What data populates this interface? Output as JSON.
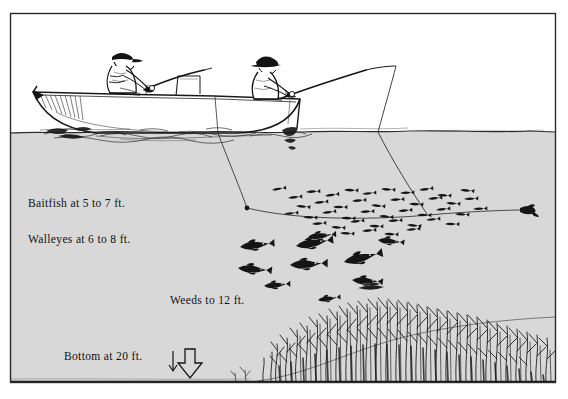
{
  "illustration": {
    "title": "Walleye trolling over a weed bed",
    "medium": "pen-and-ink line drawing",
    "border": {
      "color": "#2a2a2a",
      "x": 10,
      "y": 13,
      "width": 546,
      "height": 370
    }
  },
  "colors": {
    "sky": "#ffffff",
    "water": "#d8d8d8",
    "ink": "#111111",
    "line_ink": "#2b2b2b",
    "paper": "#ffffff"
  },
  "labels": [
    {
      "id": "baitfish-depth",
      "text": "Baitfish at 5 to 7 ft.",
      "x": 28,
      "y": 207
    },
    {
      "id": "walleye-depth",
      "text": "Walleyes at 6 to 8 ft.",
      "x": 28,
      "y": 243
    },
    {
      "id": "weeds-depth",
      "text": "Weeds to 12 ft.",
      "x": 170,
      "y": 304
    },
    {
      "id": "bottom-depth",
      "text": "Bottom at 20 ft.",
      "x": 64,
      "y": 360
    }
  ],
  "scene": {
    "waterline_y": 132,
    "lakebed_y": 381,
    "boat": {
      "name": "fishing-boat",
      "bow_x": 33,
      "stern_x": 300,
      "gunwale_y": 96
    },
    "anglers": [
      {
        "id": "angler-bow",
        "hat": "cap",
        "x": 120,
        "y": 58,
        "rod_direction": "right"
      },
      {
        "id": "angler-stern",
        "hat": "brimmed-hat",
        "x": 266,
        "y": 62,
        "rod_direction": "right"
      }
    ],
    "lines": [
      {
        "id": "trolling-line-left",
        "enters_water_x": 218,
        "weight_x": 247,
        "weight_y": 208
      },
      {
        "id": "trolling-line-right",
        "enters_water_x": 378,
        "lure_x": 527,
        "lure_y": 210
      }
    ],
    "fish": {
      "baitfish_school": {
        "count": 44,
        "depth_range_ft": [
          5,
          7
        ],
        "center_x": 360,
        "center_y": 208
      },
      "walleyes": {
        "count": 9,
        "depth_range_ft": [
          6,
          8
        ],
        "center_x": 310,
        "center_y": 262
      }
    },
    "weeds": {
      "top_ft": 12,
      "from_x": 270,
      "to_x": 556,
      "base_y": 381
    }
  }
}
